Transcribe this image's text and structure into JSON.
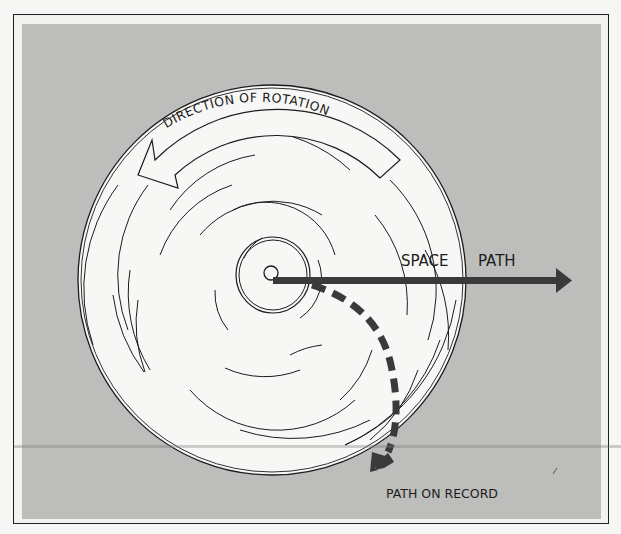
{
  "diagram": {
    "labels": {
      "rotation": "DIRECTION OF ROTATION",
      "space_path_1": "SPACE",
      "space_path_2": "PATH",
      "path_on_record": "PATH ON RECORD"
    },
    "icons": {
      "rotation_arrow": "curved-left-arrow-outline",
      "space_path_arrow": "right-arrow-solid",
      "record_path_arrow": "dashed-curved-down-arrow"
    },
    "colors": {
      "background_panel": "#bdbdbb",
      "record_disc": "#f7f7f5",
      "ink": "#1c1c1c",
      "arrow_fill": "#3a3a3a"
    }
  }
}
